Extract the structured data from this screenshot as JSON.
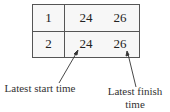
{
  "table": {
    "rows": [
      {
        "id": "1",
        "start": "24",
        "finish": "26"
      },
      {
        "id": "2",
        "start": "24",
        "finish": "26"
      }
    ]
  },
  "annotations": {
    "start_label": "Latest start time",
    "finish_label": "Latest finish time"
  }
}
